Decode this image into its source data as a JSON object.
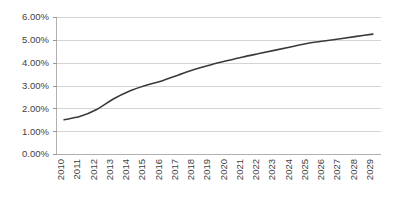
{
  "chart_data": {
    "type": "line",
    "title": "",
    "subtitle": "",
    "xlabel": "",
    "ylabel": "",
    "categories": [
      "2010",
      "2011",
      "2012",
      "2013",
      "2014",
      "2015",
      "2016",
      "2017",
      "2018",
      "2019",
      "2020",
      "2021",
      "2022",
      "2023",
      "2024",
      "2025",
      "2026",
      "2027",
      "2028",
      "2029"
    ],
    "x": [
      2010,
      2011,
      2012,
      2013,
      2014,
      2015,
      2016,
      2017,
      2018,
      2019,
      2020,
      2021,
      2022,
      2023,
      2024,
      2025,
      2026,
      2027,
      2028,
      2029
    ],
    "values": [
      1.5,
      1.65,
      1.95,
      2.4,
      2.75,
      3.0,
      3.2,
      3.45,
      3.7,
      3.9,
      4.08,
      4.25,
      4.4,
      4.55,
      4.7,
      4.85,
      4.95,
      5.05,
      5.15,
      5.25
    ],
    "series": [
      {
        "name": "",
        "values": [
          1.5,
          1.65,
          1.95,
          2.4,
          2.75,
          3.0,
          3.2,
          3.45,
          3.7,
          3.9,
          4.08,
          4.25,
          4.4,
          4.55,
          4.7,
          4.85,
          4.95,
          5.05,
          5.15,
          5.25
        ]
      }
    ],
    "ylim": [
      0,
      6
    ],
    "ytick_values": [
      0,
      1,
      2,
      3,
      4,
      5,
      6
    ],
    "ytick_labels": [
      "0.00%",
      "1.00%",
      "2.00%",
      "3.00%",
      "4.00%",
      "5.00%",
      "6.00%"
    ],
    "xtick_labels": [
      "2010",
      "2011",
      "2012",
      "2013",
      "2014",
      "2015",
      "2016",
      "2017",
      "2018",
      "2019",
      "2020",
      "2021",
      "2022",
      "2023",
      "2024",
      "2025",
      "2026",
      "2027",
      "2028",
      "2029"
    ],
    "xtick_rotation": -90,
    "grid": true,
    "grid_axis": "y",
    "legend": false,
    "legend_position": "none",
    "unit": "%",
    "colors": {
      "line": "#3a3a3a",
      "gridline": "#d4d4d4",
      "axis": "#b0b0b0",
      "tick": "#9a9a9a",
      "label_text": "#3f3f3f",
      "background": "#ffffff"
    },
    "annotations": []
  },
  "layout": {
    "plot_left": 56,
    "plot_right": 381,
    "plot_top": 17,
    "plot_bottom": 154
  }
}
